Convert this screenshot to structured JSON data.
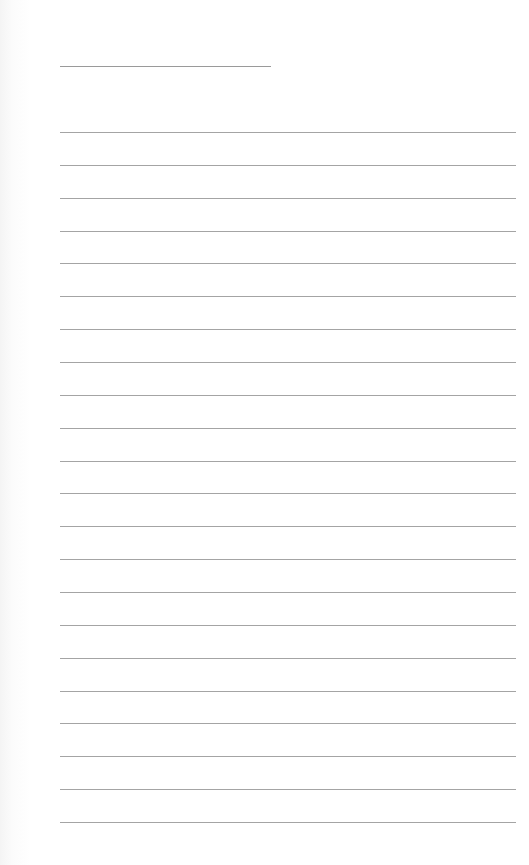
{
  "document": {
    "type": "blank-lined-sheet",
    "title_line": {
      "label": ""
    },
    "lines": [
      {
        "text": ""
      },
      {
        "text": ""
      },
      {
        "text": ""
      },
      {
        "text": ""
      },
      {
        "text": ""
      },
      {
        "text": ""
      },
      {
        "text": ""
      },
      {
        "text": ""
      },
      {
        "text": ""
      },
      {
        "text": ""
      },
      {
        "text": ""
      },
      {
        "text": ""
      },
      {
        "text": ""
      },
      {
        "text": ""
      },
      {
        "text": ""
      },
      {
        "text": ""
      },
      {
        "text": ""
      },
      {
        "text": ""
      },
      {
        "text": ""
      },
      {
        "text": ""
      },
      {
        "text": ""
      },
      {
        "text": ""
      }
    ],
    "line_color": "#a4a4a4",
    "background_color": "#ffffff"
  }
}
